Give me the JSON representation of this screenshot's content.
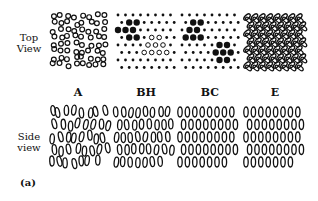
{
  "row_labels": {
    "top": "Top\nView",
    "side": "Side\nview"
  },
  "figure_tag": "(a)",
  "phases": [
    {
      "label": "A",
      "top_style": "random-rings",
      "side_style": "disordered"
    },
    {
      "label": "BH",
      "top_style": "hex-dots-with-cluster-and-triangle",
      "side_style": "twisted-columns"
    },
    {
      "label": "BC",
      "top_style": "hex-dots-with-large-clusters",
      "side_style": "ordered-offset"
    },
    {
      "label": "E",
      "top_style": "herringbone-ellipses",
      "side_style": "ordered-offset"
    }
  ],
  "colors": {
    "ink": "#111111",
    "background": "#ffffff"
  }
}
